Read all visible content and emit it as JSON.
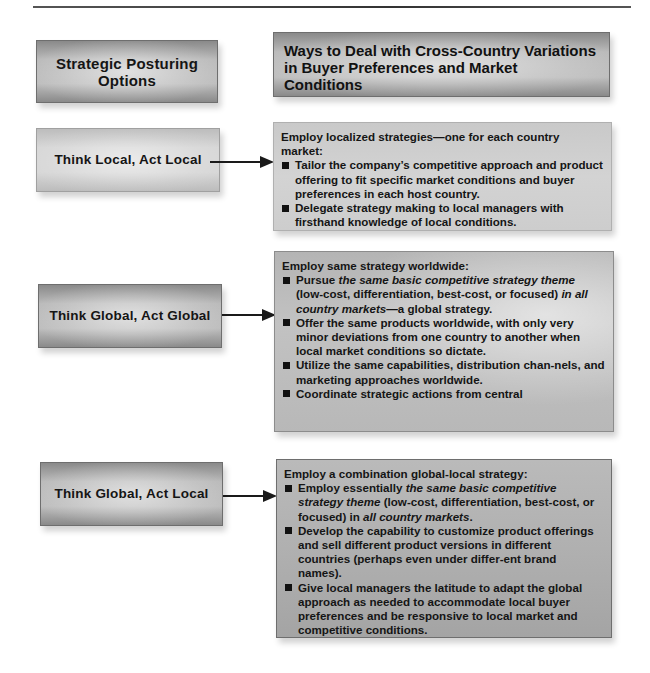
{
  "header": {
    "left_title": "Strategic Posturing Options",
    "right_title": "Ways to Deal with Cross-Country Variations in Buyer Preferences and Market Conditions"
  },
  "rows": [
    {
      "option": "Think Local, Act Local",
      "lead": "Employ localized strategies—one for each country market:",
      "bullets": [
        {
          "parts": [
            {
              "text": "Tailor the company’s competitive approach and product offering to fit specific market conditions and buyer preferences in each host country.",
              "italic": false
            }
          ]
        },
        {
          "parts": [
            {
              "text": "Delegate strategy making to local managers with firsthand knowledge of local conditions.",
              "italic": false
            }
          ]
        }
      ]
    },
    {
      "option": "Think Global, Act Global",
      "lead": "Employ same strategy worldwide:",
      "bullets": [
        {
          "parts": [
            {
              "text": "Pursue ",
              "italic": false
            },
            {
              "text": "the same basic competitive strategy theme",
              "italic": true
            },
            {
              "text": " (low-cost, differentiation, best-cost, or focused) ",
              "italic": false
            },
            {
              "text": "in all country markets",
              "italic": true
            },
            {
              "text": "—a global strategy.",
              "italic": false
            }
          ]
        },
        {
          "parts": [
            {
              "text": "Offer the same products worldwide, with only very minor deviations from one country to another when local market conditions so dictate.",
              "italic": false
            }
          ]
        },
        {
          "parts": [
            {
              "text": "Utilize the same capabilities, distribution chan-nels, and marketing approaches worldwide.",
              "italic": false
            }
          ]
        },
        {
          "parts": [
            {
              "text": "Coordinate strategic actions from central",
              "italic": false
            }
          ]
        }
      ]
    },
    {
      "option": "Think Global, Act Local",
      "lead": "Employ a combination global-local strategy:",
      "bullets": [
        {
          "parts": [
            {
              "text": "Employ essentially ",
              "italic": false
            },
            {
              "text": "the same basic competitive strategy theme",
              "italic": true
            },
            {
              "text": " (low-cost, differentiation, best-cost, or focused) in ",
              "italic": false
            },
            {
              "text": "all country markets",
              "italic": true
            },
            {
              "text": ".",
              "italic": false
            }
          ]
        },
        {
          "parts": [
            {
              "text": "Develop the capability to customize product offerings and sell different product versions in different countries (perhaps even under differ-ent brand names).",
              "italic": false
            }
          ]
        },
        {
          "parts": [
            {
              "text": "Give local managers the latitude to adapt the global approach as needed to accommodate local buyer preferences and be responsive to local market and competitive conditions.",
              "italic": false
            }
          ]
        }
      ]
    }
  ],
  "colors": {
    "text": "#151515",
    "arrow": "#1a1a1a",
    "box_gray": "#bdbdbd"
  }
}
